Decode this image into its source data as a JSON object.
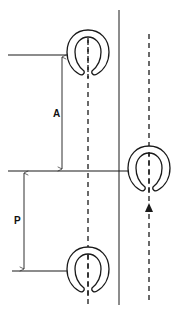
{
  "diagram": {
    "title": "",
    "labels": {
      "dimension_a": "A",
      "dimension_p": "P"
    },
    "elements": {
      "horseshoe_prints": [
        {
          "id": "hoof-print-1",
          "side": "left",
          "cx": 88,
          "top": 30
        },
        {
          "id": "hoof-print-2",
          "side": "right",
          "cx": 149,
          "top": 146
        },
        {
          "id": "hoof-print-3",
          "side": "left",
          "cx": 88,
          "top": 247
        }
      ],
      "center_lines": [
        "left-track-center-line",
        "right-track-center-line"
      ],
      "divider": "vertical-reference-line",
      "direction": "up-arrow"
    },
    "colors": {
      "stroke": "#1a1a1a",
      "background": "#ffffff"
    }
  }
}
